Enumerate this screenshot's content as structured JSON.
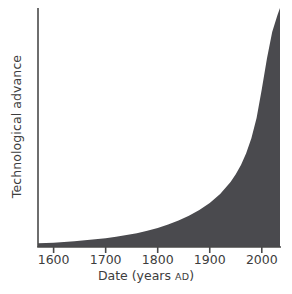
{
  "chart_data": {
    "type": "area",
    "title": "",
    "xlabel": "Date (years AD)",
    "xlabel_main": "Date (years ",
    "xlabel_era": "AD",
    "xlabel_close": ")",
    "ylabel": "Technological advance",
    "xlim": [
      1570,
      2035
    ],
    "ylim": [
      0,
      1
    ],
    "grid": false,
    "legend": false,
    "xticks": [
      1600,
      1700,
      1800,
      1900,
      2000
    ],
    "xticklabels": [
      "1600",
      "1700",
      "1800",
      "1900",
      "2000"
    ],
    "yticks": [],
    "yticklabels": [],
    "series": [
      {
        "name": "Technological advance",
        "fill": true,
        "fill_color": "#4a4a4e",
        "x": [
          1570,
          1600,
          1620,
          1640,
          1660,
          1680,
          1700,
          1720,
          1740,
          1760,
          1780,
          1800,
          1820,
          1840,
          1860,
          1880,
          1900,
          1920,
          1940,
          1950,
          1960,
          1970,
          1980,
          1990,
          2000,
          2010,
          2020,
          2030,
          2035
        ],
        "y": [
          0.016,
          0.018,
          0.021,
          0.024,
          0.028,
          0.032,
          0.037,
          0.043,
          0.05,
          0.058,
          0.068,
          0.08,
          0.094,
          0.111,
          0.131,
          0.155,
          0.184,
          0.222,
          0.272,
          0.304,
          0.343,
          0.392,
          0.455,
          0.54,
          0.66,
          0.79,
          0.9,
          0.97,
          1.0
        ]
      }
    ],
    "annotations": []
  },
  "style": {
    "axis_color": "#4a4a4a",
    "text_color": "#3d3d3d",
    "fill_color": "#4a4a4e",
    "background": "#ffffff"
  },
  "geometry": {
    "axis_x": 38,
    "axis_top": 8,
    "baseline_y": 247,
    "plot_right": 280,
    "tick_length": 6,
    "century_px": 48
  }
}
